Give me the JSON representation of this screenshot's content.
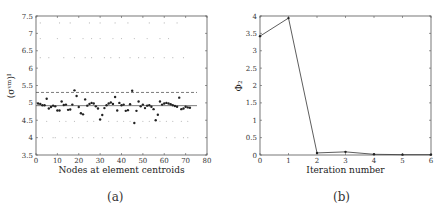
{
  "chart_data": [
    {
      "type": "scatter",
      "panel_label": "(a)",
      "xlabel": "Nodes at element centroids",
      "ylabel": "(σ^vm)_I",
      "xlim": [
        0,
        80
      ],
      "ylim": [
        3.5,
        7.5
      ],
      "xticks": [
        "0",
        "10",
        "20",
        "30",
        "40",
        "50",
        "60",
        "70",
        "80"
      ],
      "yticks": [
        "3.5",
        "4",
        "4.5",
        "5",
        "5.5",
        "6",
        "6.5",
        "7",
        "7.5"
      ],
      "reference_lines": [
        {
          "style": "solid",
          "y": 4.92
        },
        {
          "style": "dashed",
          "y": 5.3
        }
      ],
      "series": [
        {
          "name": "nodal values",
          "x": [
            1,
            2,
            3,
            4,
            5,
            6,
            7,
            8,
            9,
            10,
            11,
            12,
            13,
            14,
            15,
            16,
            17,
            18,
            19,
            20,
            21,
            22,
            23,
            24,
            25,
            26,
            27,
            28,
            29,
            30,
            31,
            32,
            33,
            34,
            35,
            36,
            37,
            38,
            39,
            40,
            41,
            42,
            43,
            44,
            45,
            46,
            47,
            48,
            49,
            50,
            51,
            52,
            53,
            54,
            55,
            56,
            57,
            58,
            59,
            60,
            61,
            62,
            63,
            64,
            65,
            66,
            67,
            68,
            69,
            70,
            71,
            72
          ],
          "y": [
            4.98,
            4.97,
            4.93,
            4.93,
            5.12,
            4.84,
            4.88,
            4.92,
            4.9,
            4.78,
            4.78,
            5.04,
            4.94,
            4.95,
            4.8,
            4.81,
            4.95,
            5.36,
            5.2,
            4.88,
            4.7,
            4.67,
            5.1,
            4.92,
            4.97,
            5.0,
            4.98,
            4.9,
            4.84,
            4.52,
            4.65,
            4.85,
            4.93,
            4.98,
            5.01,
            4.97,
            5.17,
            4.78,
            5.0,
            4.93,
            4.95,
            4.77,
            4.79,
            4.96,
            5.35,
            4.42,
            4.77,
            5.04,
            4.9,
            4.95,
            4.85,
            4.92,
            4.93,
            4.89,
            4.82,
            4.5,
            4.66,
            5.04,
            4.95,
            4.98,
            5.0,
            4.98,
            4.96,
            4.93,
            4.91,
            4.89,
            5.15,
            4.82,
            4.84,
            4.89,
            4.87,
            4.86
          ]
        }
      ]
    },
    {
      "type": "line",
      "panel_label": "(b)",
      "xlabel": "Iteration number",
      "ylabel": "Φ₂",
      "xlim": [
        0,
        6
      ],
      "ylim": [
        0,
        4
      ],
      "xticks": [
        "0",
        "1",
        "2",
        "3",
        "4",
        "5",
        "6"
      ],
      "yticks": [
        "0",
        "0.5",
        "1",
        "1.5",
        "2",
        "2.5",
        "3",
        "3.5",
        "4"
      ],
      "series": [
        {
          "name": "Φ2",
          "x": [
            0,
            1,
            2,
            3,
            4,
            5,
            6
          ],
          "y": [
            3.42,
            3.94,
            0.06,
            0.09,
            0.02,
            0.01,
            0.01
          ]
        }
      ]
    }
  ],
  "captions": {
    "a": "(a)",
    "b": "(b)"
  }
}
